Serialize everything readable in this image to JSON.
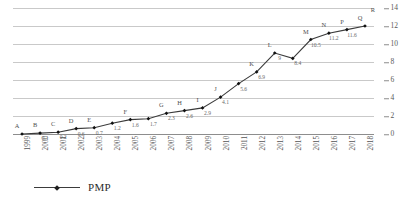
{
  "chart_data": {
    "type": "line",
    "title": "",
    "xlabel": "",
    "ylabel": "",
    "ylim": [
      0,
      14
    ],
    "yticks": [
      0,
      2,
      4,
      6,
      8,
      10,
      12,
      14
    ],
    "y_axis_position": "right",
    "grid": true,
    "legend_position": "bottom-left",
    "categories": [
      "1999",
      "2000",
      "2001",
      "2002",
      "2003",
      "2004",
      "2005",
      "2006",
      "2007",
      "2008",
      "2009",
      "2010",
      "2011",
      "2012",
      "2013",
      "2014",
      "2015",
      "2016",
      "2017",
      "2018"
    ],
    "series": [
      {
        "name": "PMP",
        "color": "#3b3b3b",
        "values": [
          0,
          0.1,
          0.2,
          0.6,
          0.7,
          1.2,
          1.6,
          1.7,
          2.3,
          2.6,
          2.9,
          4.1,
          5.6,
          6.9,
          9,
          8.4,
          10.5,
          11.2,
          11.6,
          12
        ]
      }
    ],
    "point_labels": [
      "A",
      "B",
      "C",
      "D",
      "E",
      "",
      "F",
      "",
      "G",
      "H",
      "I",
      "J",
      "K",
      "L",
      "M",
      "N",
      "P",
      "Q",
      "R"
    ],
    "value_labels": [
      "0.1",
      "0.2",
      "0.6",
      "0.7",
      "1.2",
      "1.6",
      "1.7",
      "2.3",
      "2.6",
      "2.9",
      "4.1",
      "5.6",
      "6.9",
      "9",
      "8.4",
      "10.5",
      "11.2",
      "11.6"
    ]
  },
  "annotations": [
    {
      "letter": "A",
      "value": "",
      "x": 1999,
      "y": 0
    },
    {
      "letter": "B",
      "value": "0.1",
      "x": 2000,
      "y": 0.1
    },
    {
      "letter": "C",
      "value": "0.2",
      "x": 2001,
      "y": 0.2
    },
    {
      "letter": "D",
      "value": "0.6",
      "x": 2002,
      "y": 0.6
    },
    {
      "letter": "E",
      "value": "0.7",
      "x": 2003,
      "y": 0.7
    },
    {
      "letter": "",
      "value": "1.2",
      "x": 2004,
      "y": 1.2
    },
    {
      "letter": "",
      "value": "1.6",
      "x": 2005,
      "y": 1.6
    },
    {
      "letter": "",
      "value": "1.7",
      "x": 2006,
      "y": 1.7
    },
    {
      "letter": "F",
      "value": "2.3",
      "x": 2007,
      "y": 2.3
    },
    {
      "letter": "",
      "value": "2.6",
      "x": 2008,
      "y": 2.6
    },
    {
      "letter": "",
      "value": "2.9",
      "x": 2009,
      "y": 2.9
    },
    {
      "letter": "G",
      "value": "4.1",
      "x": 2010,
      "y": 4.1
    },
    {
      "letter": "H",
      "value": "5.6",
      "x": 2011,
      "y": 5.6
    },
    {
      "letter": "I",
      "value": "6.9",
      "x": 2012,
      "y": 6.9
    },
    {
      "letter": "J",
      "value": "",
      "x": 2012,
      "y": 8.1
    },
    {
      "letter": "K",
      "value": "9",
      "x": 2013,
      "y": 9
    },
    {
      "letter": "",
      "value": "8.4",
      "x": 2014,
      "y": 8.4
    },
    {
      "letter": "L",
      "value": "10.5",
      "x": 2015,
      "y": 10.5
    },
    {
      "letter": "M",
      "value": "",
      "x": 2015,
      "y": 10.6
    },
    {
      "letter": "N",
      "value": "11.2",
      "x": 2016,
      "y": 11.2
    },
    {
      "letter": "P",
      "value": "11.6",
      "x": 2017,
      "y": 11.6
    },
    {
      "letter": "Q",
      "value": "",
      "x": 2018,
      "y": 12
    },
    {
      "letter": "R",
      "value": "",
      "x": 2018,
      "y": 12
    }
  ],
  "legend": {
    "label": "PMP",
    "marker": "diamond-marker"
  },
  "colors": {
    "line": "#3b3b3b",
    "grid": "#c9c9c9",
    "axis": "#8d8d8d",
    "text": "#4f4f4f"
  }
}
